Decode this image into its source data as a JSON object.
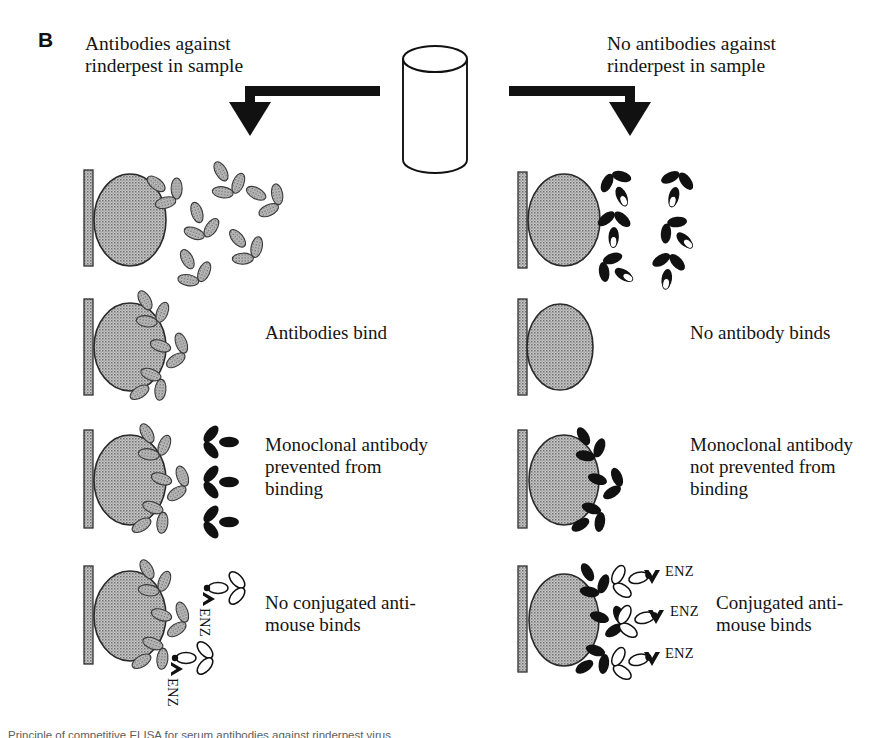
{
  "figure": {
    "panel_letter": "B",
    "background_color": "#ffffff",
    "ink_color": "#111111",
    "grey_fill": "#9a9a9a",
    "black_fill": "#111111",
    "white_fill": "#ffffff"
  },
  "columns": {
    "left": {
      "heading": "Antibodies against\nrinderpest in sample",
      "arrow": "down-arrow-left"
    },
    "right": {
      "heading": "No antibodies against\nrinderpest in sample",
      "arrow": "down-arrow-right"
    }
  },
  "vessel": {
    "name": "sample-tube",
    "label": ""
  },
  "steps": [
    {
      "id": "step-1",
      "left_caption": "",
      "right_caption": "",
      "left_antibody_color": "grey",
      "right_antibody_color": "black",
      "left_free_antibodies": 6,
      "right_free_antibodies": 6,
      "bound_antibodies_left": 1,
      "bound_antibodies_right": 0
    },
    {
      "id": "step-2",
      "left_caption": "Antibodies bind",
      "right_caption": "No antibody  binds",
      "left_antibody_color": "grey",
      "right_antibody_color": "none",
      "bound_antibodies_left": 3,
      "bound_antibodies_right": 0
    },
    {
      "id": "step-3",
      "left_caption": "Monoclonal antibody\nprevented from\nbinding",
      "right_caption": "Monoclonal antibody\nnot prevented from\nbinding",
      "left_antibody_color": "grey",
      "monoclonal_color": "black",
      "left_free_monoclonals": 3,
      "right_bound_monoclonals": 3
    },
    {
      "id": "step-4",
      "left_caption": "No conjugated anti-\nmouse binds",
      "right_caption": "Conjugated anti-\nmouse binds",
      "conjugate_color": "white",
      "enzyme_label": "ENZ",
      "left_free_conjugates": 2,
      "right_bound_conjugates": 3
    }
  ],
  "enzyme_labels": {
    "left": [
      "ENZ",
      "ENZ"
    ],
    "right": [
      "ENZ",
      "ENZ",
      "ENZ"
    ]
  },
  "bottom_caption": {
    "text": "Principle of competitive ELISA for serum antibodies against rinderpest virus"
  }
}
